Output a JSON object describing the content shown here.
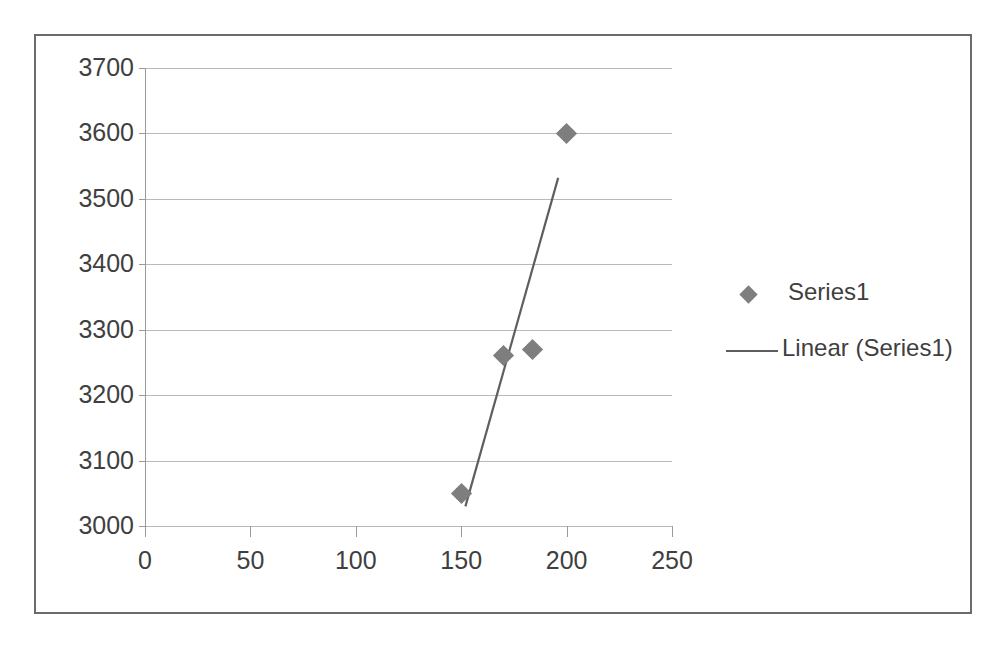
{
  "chart_data": {
    "type": "scatter",
    "title": "",
    "xlabel": "",
    "ylabel": "",
    "xlim": [
      0,
      250
    ],
    "ylim": [
      3000,
      3700
    ],
    "xticks": [
      0,
      50,
      100,
      150,
      200,
      250
    ],
    "yticks": [
      3000,
      3100,
      3200,
      3300,
      3400,
      3500,
      3600,
      3700
    ],
    "grid": "horizontal",
    "legend_position": "right",
    "series": [
      {
        "name": "Series1",
        "marker": "diamond",
        "color": "#7e7e7e",
        "points": [
          {
            "x": 150,
            "y": 3050
          },
          {
            "x": 170,
            "y": 3260
          },
          {
            "x": 184,
            "y": 3270
          },
          {
            "x": 200,
            "y": 3600
          }
        ]
      },
      {
        "name": "Linear (Series1)",
        "type": "trendline",
        "color": "#5e5e5e",
        "x_start": 152,
        "y_start": 3030,
        "x_end": 196,
        "y_end": 3532
      }
    ]
  },
  "axes": {
    "y_tick_labels": [
      "3700",
      "3600",
      "3500",
      "3400",
      "3300",
      "3200",
      "3100",
      "3000"
    ],
    "x_tick_labels": [
      "0",
      "50",
      "100",
      "150",
      "200",
      "250"
    ]
  },
  "legend": {
    "entries": [
      {
        "label": "Series1",
        "swatch": "diamond-marker"
      },
      {
        "label": "Linear (Series1)",
        "swatch": "line-swatch"
      }
    ]
  },
  "colors": {
    "marker": "#7e7e7e",
    "trendline": "#5e5e5e",
    "gridline": "#b9b9b9",
    "axis": "#9a9a9a",
    "text": "#3f3f3f",
    "border": "#6b6b6b",
    "background": "#ffffff"
  }
}
